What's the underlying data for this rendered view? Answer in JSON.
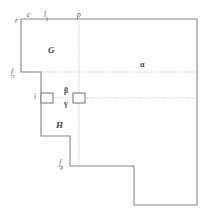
{
  "figure": {
    "background_color": "#ffffff",
    "outline_color": "#808080",
    "dotted_color": "#c8c8c8",
    "label_color": "#4a4a4a",
    "width": 210,
    "height": 213
  },
  "regions": [
    {
      "id": "G",
      "label": "G",
      "x": 48,
      "y": 46
    },
    {
      "id": "alpha",
      "label": "α",
      "x": 140,
      "y": 61
    },
    {
      "id": "beta",
      "label": "β",
      "x": 64,
      "y": 87
    },
    {
      "id": "gamma",
      "label": "γ",
      "x": 64,
      "y": 100
    },
    {
      "id": "H",
      "label": "H",
      "x": 56,
      "y": 121
    }
  ],
  "markers": [
    {
      "id": "r",
      "label": "r",
      "sub": "",
      "x": 15,
      "y": 17
    },
    {
      "id": "c",
      "label": "c",
      "sub": "",
      "x": 27,
      "y": 11
    },
    {
      "id": "l1",
      "label": "l",
      "sub": "1",
      "x": 44,
      "y": 11
    },
    {
      "id": "p",
      "label": "p",
      "sub": "",
      "x": 77,
      "y": 11
    },
    {
      "id": "fc",
      "label": "f",
      "sub": "c",
      "x": 11,
      "y": 68
    },
    {
      "id": "i",
      "label": "i",
      "sub": "",
      "x": 34,
      "y": 93
    },
    {
      "id": "fp",
      "label": "f",
      "sub": "p",
      "x": 59,
      "y": 159
    }
  ],
  "geometry": {
    "outline_path": "M 21 19 L 197 19 L 197 205 L 134 205 L 134 166 L 70 166 L 70 136 L 41 136 L 41 72 L 21 72 Z",
    "small_boxes": [
      {
        "id": "box-i",
        "x": 41,
        "y": 93,
        "w": 12,
        "h": 10
      },
      {
        "id": "box-gamma-right",
        "x": 73,
        "y": 93,
        "w": 12,
        "h": 10
      }
    ],
    "dotted_lines": [
      {
        "id": "vertical-p",
        "x1": 79,
        "y1": 19,
        "x2": 79,
        "y2": 166
      },
      {
        "id": "horizontal-fc",
        "x1": 21,
        "y1": 72,
        "x2": 197,
        "y2": 72
      },
      {
        "id": "horizontal-gamma",
        "x1": 41,
        "y1": 98,
        "x2": 197,
        "y2": 98
      }
    ]
  }
}
